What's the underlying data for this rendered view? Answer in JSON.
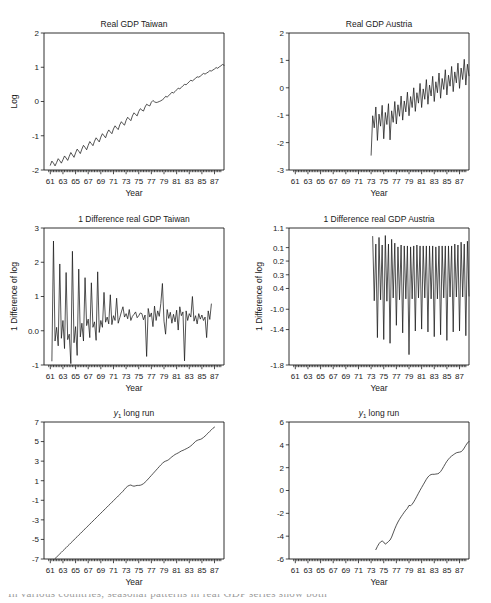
{
  "figure": {
    "panel_count": 6,
    "line_color": "#1a1a1a",
    "background": "#ffffff",
    "caption_partial": "In various countries, seasonal patterns in real GDP series show both"
  },
  "chart_data": [
    {
      "id": "real-gdp-taiwan",
      "type": "line",
      "title": "Real GDP Taiwan",
      "title_plain": "Real GDP Taiwan",
      "xlabel": "Year",
      "ylabel": "Log",
      "xlim": [
        60.0,
        88.5
      ],
      "ylim": [
        -2,
        2
      ],
      "yticks": [
        2,
        1,
        0,
        -1,
        -2
      ],
      "ytick_labels": [
        "2",
        "1",
        "0",
        "-1",
        "-2"
      ],
      "xticks": [
        61,
        63,
        65,
        67,
        69,
        71,
        73,
        75,
        77,
        79,
        81,
        83,
        85,
        87
      ],
      "xtick_labels": [
        "61",
        "63",
        "65",
        "67",
        "69",
        "71",
        "73",
        "75",
        "77",
        "79",
        "81",
        "83",
        "85",
        "87"
      ],
      "minor_tick_step": 0.25,
      "grid": false,
      "x_start": 61.0,
      "x_step": 0.25,
      "values": [
        -1.86,
        -1.74,
        -1.8,
        -1.88,
        -1.78,
        -1.67,
        -1.73,
        -1.8,
        -1.7,
        -1.59,
        -1.65,
        -1.72,
        -1.6,
        -1.49,
        -1.56,
        -1.63,
        -1.5,
        -1.39,
        -1.45,
        -1.52,
        -1.39,
        -1.28,
        -1.34,
        -1.41,
        -1.28,
        -1.17,
        -1.23,
        -1.29,
        -1.16,
        -1.06,
        -1.12,
        -1.18,
        -1.04,
        -0.94,
        -1.0,
        -1.06,
        -0.92,
        -0.83,
        -0.89,
        -0.94,
        -0.8,
        -0.71,
        -0.77,
        -0.82,
        -0.68,
        -0.59,
        -0.65,
        -0.69,
        -0.55,
        -0.46,
        -0.51,
        -0.56,
        -0.42,
        -0.33,
        -0.38,
        -0.42,
        -0.29,
        -0.21,
        -0.25,
        -0.28,
        -0.16,
        -0.08,
        -0.11,
        -0.13,
        -0.02,
        0.03,
        -0.01,
        -0.03,
        -0.02,
        0.0,
        0.02,
        0.05,
        0.09,
        0.15,
        0.13,
        0.17,
        0.22,
        0.27,
        0.25,
        0.29,
        0.34,
        0.39,
        0.37,
        0.41,
        0.46,
        0.5,
        0.49,
        0.53,
        0.58,
        0.62,
        0.6,
        0.64,
        0.68,
        0.72,
        0.71,
        0.74,
        0.78,
        0.82,
        0.8,
        0.83,
        0.86,
        0.9,
        0.89,
        0.92,
        0.95,
        0.99,
        0.97,
        1.01,
        1.04,
        1.08,
        1.06,
        1.1,
        1.13,
        1.17,
        1.16,
        1.2,
        1.24,
        1.28,
        1.27,
        1.31,
        1.35,
        1.4,
        1.39,
        1.44,
        1.49,
        1.54,
        1.53,
        1.58,
        1.63
      ]
    },
    {
      "id": "real-gdp-austria",
      "type": "line",
      "title": "Real GDP Austria",
      "title_plain": "Real GDP Austria",
      "xlabel": "Year",
      "ylabel": "",
      "xlim": [
        60.0,
        88.5
      ],
      "ylim": [
        -3,
        2
      ],
      "yticks": [
        2,
        1,
        0,
        -1,
        -2,
        -3
      ],
      "ytick_labels": [
        "2",
        "1",
        "0",
        "-1",
        "-2",
        "-3"
      ],
      "xticks": [
        61,
        63,
        65,
        67,
        69,
        71,
        73,
        75,
        77,
        79,
        81,
        83,
        85,
        87
      ],
      "xtick_labels": [
        "61",
        "63",
        "65",
        "67",
        "69",
        "71",
        "73",
        "75",
        "77",
        "79",
        "81",
        "83",
        "85",
        "87"
      ],
      "minor_tick_step": 0.25,
      "grid": false,
      "x_start": 73.0,
      "x_step": 0.25,
      "values": [
        -2.46,
        -1.02,
        -1.46,
        -0.7,
        -1.92,
        -0.96,
        -1.4,
        -0.64,
        -1.86,
        -0.9,
        -1.34,
        -0.58,
        -1.9,
        -0.84,
        -1.26,
        -0.5,
        -1.32,
        -0.62,
        -1.04,
        -0.3,
        -1.18,
        -0.48,
        -0.88,
        -0.16,
        -1.02,
        -0.32,
        -0.72,
        0.0,
        -0.86,
        -0.18,
        -0.56,
        0.16,
        -0.72,
        -0.04,
        -0.42,
        0.3,
        -0.6,
        0.1,
        -0.3,
        0.42,
        -0.5,
        0.22,
        -0.18,
        0.54,
        -0.38,
        0.34,
        -0.06,
        0.66,
        -0.26,
        0.46,
        0.06,
        0.78,
        -0.14,
        0.58,
        0.18,
        0.9,
        -0.02,
        0.72,
        0.3,
        1.04,
        0.1,
        0.86,
        0.44,
        1.18,
        0.22,
        1.0,
        0.58,
        1.32,
        0.32,
        1.14,
        0.7,
        1.46,
        0.42,
        1.28,
        0.82,
        1.6,
        0.52,
        1.42,
        0.94,
        1.72,
        0.62,
        1.5
      ]
    },
    {
      "id": "diff-real-gdp-taiwan",
      "type": "line",
      "title": "1 Difference real GDP Taiwan",
      "title_plain": "1 Difference real GDP Taiwan",
      "xlabel": "Year",
      "ylabel": "1 Difference of log",
      "xlim": [
        60.0,
        88.5
      ],
      "ylim": [
        -1,
        3
      ],
      "yticks": [
        3,
        2,
        1,
        0,
        -1
      ],
      "ytick_labels": [
        "3",
        "2",
        "1",
        "0.0",
        "-1"
      ],
      "xticks": [
        61,
        63,
        65,
        67,
        69,
        71,
        73,
        75,
        77,
        79,
        81,
        83,
        85,
        87
      ],
      "xtick_labels": [
        "61",
        "63",
        "65",
        "67",
        "69",
        "71",
        "73",
        "75",
        "77",
        "79",
        "81",
        "83",
        "85",
        "87"
      ],
      "minor_tick_step": 0.25,
      "grid": false,
      "x_start": 61.25,
      "x_step": 0.25,
      "values": [
        -0.88,
        2.62,
        -0.3,
        0.1,
        -0.44,
        1.95,
        -0.22,
        0.3,
        -0.52,
        1.7,
        -0.26,
        -0.1,
        -0.96,
        2.32,
        -0.35,
        0.12,
        -0.72,
        1.8,
        -0.18,
        0.22,
        -0.3,
        1.55,
        0.15,
        0.34,
        -0.2,
        1.4,
        0.1,
        0.26,
        -0.28,
        1.72,
        -0.05,
        0.3,
        0.1,
        1.12,
        0.25,
        0.4,
        0.2,
        1.05,
        0.18,
        0.44,
        0.3,
        0.95,
        0.22,
        0.38,
        0.55,
        0.7,
        0.4,
        0.5,
        0.35,
        0.62,
        0.3,
        0.42,
        0.48,
        0.55,
        0.38,
        0.44,
        0.52,
        0.5,
        0.32,
        0.46,
        -0.75,
        0.65,
        0.4,
        0.52,
        0.12,
        0.72,
        0.3,
        0.58,
        0.42,
        0.8,
        1.38,
        0.28,
        -0.1,
        0.62,
        0.36,
        0.54,
        0.22,
        0.48,
        0.26,
        0.6,
        0.02,
        0.7,
        0.44,
        0.55,
        -0.88,
        0.58,
        0.3,
        0.5,
        0.4,
        1.0,
        0.28,
        0.44,
        0.2,
        0.5,
        0.34,
        0.46,
        0.3,
        0.4,
        -0.2,
        0.58,
        0.33,
        0.78
      ]
    },
    {
      "id": "diff-real-gdp-austria",
      "type": "line",
      "title": "1 Difference real GDP Austria",
      "title_plain": "1 Difference real GDP Austria",
      "xlabel": "Year",
      "ylabel": "1 Difference of log",
      "xlim": [
        60.0,
        88.5
      ],
      "ylim": [
        -1.8,
        1.1
      ],
      "yticks": [
        1.1,
        0.1,
        0.2,
        0.3,
        0.4,
        -1.0,
        -1.4,
        -1.8
      ],
      "ytick_labels": [
        "1.1",
        "0.1",
        "0.2",
        "0.3",
        "0.4",
        "-1.0",
        "-1.4",
        "-1.8"
      ],
      "ytick_positions": [
        1.1,
        0.685,
        0.4,
        0.11,
        -0.18,
        -0.62,
        -1.05,
        -1.8
      ],
      "xticks": [
        61,
        63,
        65,
        67,
        69,
        71,
        73,
        75,
        77,
        79,
        81,
        83,
        85,
        87
      ],
      "xtick_labels": [
        "61",
        "63",
        "65",
        "67",
        "69",
        "71",
        "73",
        "75",
        "77",
        "79",
        "81",
        "83",
        "85",
        "87"
      ],
      "minor_tick_step": 0.25,
      "grid": false,
      "x_start": 73.25,
      "x_step": 0.25,
      "values": [
        0.92,
        -0.44,
        0.76,
        -1.22,
        0.9,
        -0.42,
        0.74,
        -1.26,
        0.94,
        -0.45,
        0.76,
        -1.34,
        0.86,
        -0.38,
        0.78,
        -0.96,
        0.7,
        -0.42,
        0.74,
        -1.12,
        0.72,
        -0.4,
        0.72,
        -1.58,
        0.7,
        -0.4,
        0.72,
        -1.08,
        0.74,
        -0.38,
        0.72,
        -1.04,
        0.72,
        -0.38,
        0.72,
        -1.1,
        0.72,
        -0.4,
        0.72,
        -1.2,
        0.7,
        -0.4,
        0.72,
        -1.16,
        0.72,
        -0.38,
        0.72,
        -1.28,
        0.72,
        -0.36,
        0.72,
        -1.1,
        0.76,
        -0.36,
        0.74,
        -1.08,
        0.8,
        -0.36,
        0.76,
        -1.18,
        0.82,
        -0.34,
        0.78,
        -1.28,
        0.84,
        -0.34,
        0.8,
        -1.06,
        0.86,
        -0.32,
        0.82,
        -1.12,
        0.88,
        -0.32,
        0.84,
        -1.4,
        0.94,
        -0.3,
        0.86,
        -0.74,
        0.6
      ]
    },
    {
      "id": "y1-long-run-taiwan",
      "type": "line",
      "title_prefix": "y",
      "title_subscript": "1",
      "title_suffix": " long run",
      "title_plain": "y1 long run",
      "xlabel": "Year",
      "ylabel": "",
      "xlim": [
        60.0,
        88.5
      ],
      "ylim": [
        -7,
        7
      ],
      "yticks": [
        7,
        5,
        3,
        1,
        -1,
        -3,
        -5,
        -7
      ],
      "ytick_labels": [
        "7",
        "5",
        "3",
        "1",
        "-1",
        "-3",
        "-5",
        "-7"
      ],
      "xticks": [
        61,
        63,
        65,
        67,
        69,
        71,
        73,
        75,
        77,
        79,
        81,
        83,
        85,
        87
      ],
      "xtick_labels": [
        "61",
        "63",
        "65",
        "67",
        "69",
        "71",
        "73",
        "75",
        "77",
        "79",
        "81",
        "83",
        "85",
        "87"
      ],
      "minor_tick_step": 0.25,
      "grid": false,
      "x_start": 61.75,
      "x_step": 0.25,
      "values": [
        -6.95,
        -6.8,
        -6.64,
        -6.48,
        -6.32,
        -6.16,
        -6.0,
        -5.84,
        -5.68,
        -5.52,
        -5.36,
        -5.2,
        -5.04,
        -4.88,
        -4.72,
        -4.56,
        -4.4,
        -4.24,
        -4.08,
        -3.92,
        -3.76,
        -3.6,
        -3.44,
        -3.28,
        -3.12,
        -2.96,
        -2.8,
        -2.64,
        -2.48,
        -2.32,
        -2.16,
        -2.0,
        -1.84,
        -1.68,
        -1.52,
        -1.36,
        -1.2,
        -1.04,
        -0.88,
        -0.72,
        -0.56,
        -0.4,
        -0.24,
        -0.08,
        0.12,
        0.3,
        0.44,
        0.52,
        0.56,
        0.48,
        0.44,
        0.48,
        0.52,
        0.52,
        0.54,
        0.6,
        0.7,
        0.84,
        1.0,
        1.18,
        1.36,
        1.54,
        1.72,
        1.9,
        2.08,
        2.26,
        2.44,
        2.62,
        2.78,
        2.92,
        3.0,
        3.06,
        3.16,
        3.3,
        3.44,
        3.56,
        3.68,
        3.76,
        3.84,
        3.94,
        4.04,
        4.1,
        4.18,
        4.26,
        4.34,
        4.44,
        4.56,
        4.7,
        4.86,
        5.02,
        5.12,
        5.18,
        5.22,
        5.3,
        5.42,
        5.56,
        5.72,
        5.88,
        6.04,
        6.2,
        6.36,
        6.48
      ]
    },
    {
      "id": "y1-long-run-austria",
      "type": "line",
      "title_prefix": "y",
      "title_subscript": "1",
      "title_suffix": " long run",
      "title_plain": "y1 long run",
      "xlabel": "Year",
      "ylabel": "",
      "xlim": [
        60.0,
        88.5
      ],
      "ylim": [
        -6,
        6
      ],
      "yticks": [
        6,
        4,
        2,
        0,
        -2,
        -4,
        -6
      ],
      "ytick_labels": [
        "6",
        "4",
        "2",
        "0",
        "-2",
        "-4",
        "-6"
      ],
      "xticks": [
        61,
        63,
        65,
        67,
        69,
        71,
        73,
        75,
        77,
        79,
        81,
        83,
        85,
        87
      ],
      "xtick_labels": [
        "61",
        "63",
        "65",
        "67",
        "69",
        "71",
        "73",
        "75",
        "77",
        "79",
        "81",
        "83",
        "85",
        "87"
      ],
      "minor_tick_step": 0.25,
      "grid": false,
      "x_start": 73.75,
      "x_step": 0.25,
      "values": [
        -5.18,
        -4.9,
        -4.66,
        -4.5,
        -4.42,
        -4.52,
        -4.7,
        -4.6,
        -4.46,
        -4.34,
        -4.08,
        -3.72,
        -3.36,
        -3.04,
        -2.76,
        -2.52,
        -2.3,
        -2.1,
        -1.9,
        -1.72,
        -1.56,
        -1.3,
        -1.34,
        -1.2,
        -1.0,
        -0.76,
        -0.5,
        -0.24,
        0.02,
        0.26,
        0.5,
        0.74,
        0.98,
        1.18,
        1.32,
        1.4,
        1.42,
        1.42,
        1.44,
        1.46,
        1.52,
        1.66,
        1.86,
        2.1,
        2.34,
        2.56,
        2.74,
        2.9,
        3.02,
        3.12,
        3.22,
        3.3,
        3.34,
        3.36,
        3.4,
        3.52,
        3.72,
        3.96,
        4.16,
        4.3,
        4.4,
        4.46,
        4.5,
        4.56,
        4.66,
        4.78,
        4.88
      ]
    }
  ]
}
